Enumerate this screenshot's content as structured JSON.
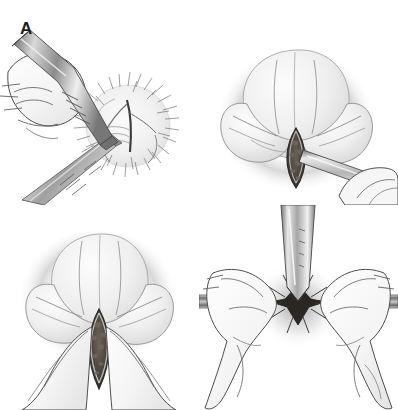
{
  "figure": {
    "style": "grayscale pen-and-ink medical illustration",
    "background_color": "#ffffff",
    "ink_color": "#1d1d1d",
    "panel_count": 4,
    "width_px": 398,
    "height_px": 410
  },
  "panels": [
    {
      "id": "a",
      "label": "A",
      "caption": "Hand holding a surgical instrument making an incision at the hair-covered site; a second instrument approaches from below.",
      "elements": {
        "hand": "gloved hand gripping instrument from upper left",
        "instrument_upper": "straight metallic handle with gradient shading",
        "instrument_lower": "second metallic instrument entering from lower left",
        "tissue": "round hair-covered anatomical mass with radiating hair strokes",
        "incision": "dark central cleft opening"
      }
    },
    {
      "id": "b",
      "label": "B",
      "caption": "Close-up of the opened incision with a cylindrical instrument introduced into the wound; fingertips steady the tissue.",
      "elements": {
        "tissue": "rounded stippled mass with soft halo of dots",
        "incision": "dark almond-shaped opening with mottled interior",
        "instrument": "cylindrical tube entering from lower right",
        "fingers": "fingertips at lower right"
      }
    },
    {
      "id": "c",
      "label": "C",
      "caption": "The incision held open by fingers on either side, revealing the mottled underlying tissue.",
      "elements": {
        "tissue": "rounded stippled mass with soft halo of dots",
        "incision": "dark elongated lens-shaped opening with mottled interior",
        "finger_left": "finger spreading tissue from lower left",
        "finger_right": "finger spreading tissue from lower right"
      }
    },
    {
      "id": "d",
      "label": "D",
      "caption": "Vertical tube inserted into the small puncture site while both hands stretch the horizontal structures apart.",
      "elements": {
        "tube": "vertical metallic tube descending into the site",
        "puncture": "dark star-shaped puncture with radiating creases",
        "hand_left": "hand gripping horizontal cylindrical structure at left",
        "hand_right": "hand gripping horizontal cylindrical structure at right",
        "shaft_left": "horizontal shaded cylinder extending left",
        "shaft_right": "horizontal shaded cylinder extending right"
      }
    }
  ]
}
